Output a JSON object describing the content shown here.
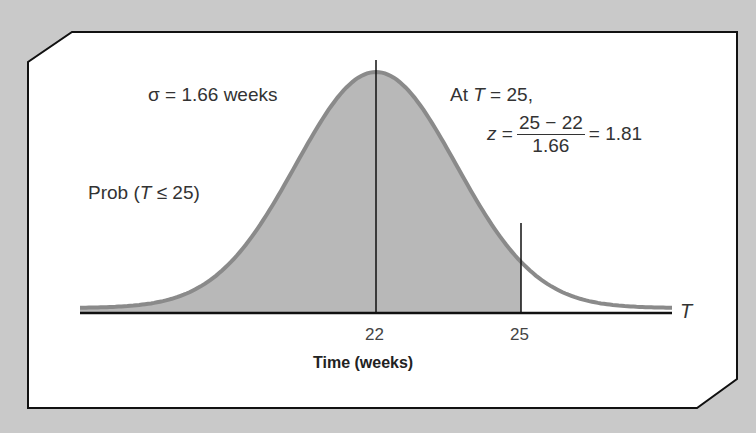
{
  "chart_data": {
    "type": "area",
    "title": "",
    "distribution": "normal",
    "mean": 22,
    "sigma": 1.66,
    "shaded_region": {
      "from": "-inf",
      "to": 25
    },
    "xlabel": "Time (weeks)",
    "axis_variable": "T",
    "x_ticks": [
      22,
      25
    ],
    "annotations": [
      "σ = 1.66 weeks",
      "Prob (T ≤ 25)",
      "At T = 25,",
      "z = (25 − 22) / 1.66 = 1.81"
    ]
  },
  "labels": {
    "sigma": "σ = 1.66 weeks",
    "prob_prefix": "Prob (",
    "prob_var": "T",
    "prob_suffix": " ≤ 25)",
    "at_prefix": "At ",
    "at_var": "T",
    "at_suffix": " = 25,",
    "z_var": "z",
    "z_eq": " =",
    "z_num": "25 − 22",
    "z_den": "1.66",
    "z_result": "= 1.81",
    "axis_var": "T",
    "tick_22": "22",
    "tick_25": "25",
    "xlabel": "Time (weeks)"
  },
  "colors": {
    "background": "#c9c9c9",
    "panel": "#ffffff",
    "shade": "#b8b8b8",
    "curve": "#8a8a8a"
  }
}
